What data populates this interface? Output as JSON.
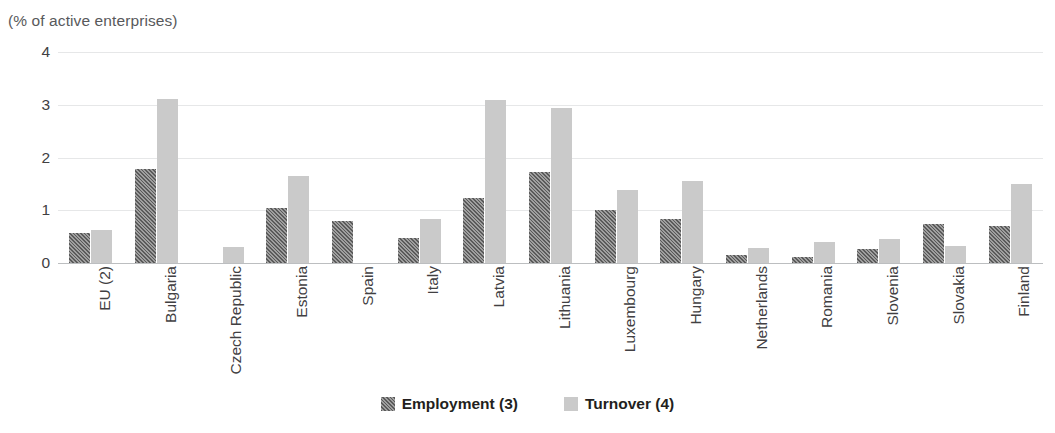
{
  "subtitle": "(% of active enterprises)",
  "clipped_title_fragment": "",
  "legend": {
    "position": "bottom-center",
    "items": [
      {
        "label": "Employment  (3)",
        "swatch": "hatched-dark-gray-swatch",
        "color": "#5a5a5a"
      },
      {
        "label": "Turnover  (4)",
        "swatch": "solid-light-gray-swatch",
        "color": "#cacaca"
      }
    ]
  },
  "axis": {
    "y_ticks": [
      "0",
      "1",
      "2",
      "3",
      "4"
    ],
    "y_min": 0,
    "y_max": 4
  },
  "colors": {
    "employment": "#5a5a5a",
    "turnover": "#cacaca",
    "gridline": "#e6e7e8",
    "baseline": "#bcbec0",
    "text": "#414042",
    "subtitle_text": "#58595b"
  },
  "chart_data": {
    "type": "bar",
    "title": "",
    "subtitle": "(% of active enterprises)",
    "xlabel": "",
    "ylabel": "(% of active enterprises)",
    "ylim": [
      0,
      4
    ],
    "yticks": [
      0,
      1,
      2,
      3,
      4
    ],
    "grid": true,
    "legend_position": "bottom-center",
    "categories": [
      "EU (2)",
      "Bulgaria",
      "Czech Republic",
      "Estonia",
      "Spain",
      "Italy",
      "Latvia",
      "Lithuania",
      "Luxembourg",
      "Hungary",
      "Netherlands",
      "Romania",
      "Slovenia",
      "Slovakia",
      "Finland"
    ],
    "series": [
      {
        "name": "Employment  (3)",
        "color": "#5a5a5a",
        "values": [
          0.57,
          1.79,
          null,
          1.05,
          0.8,
          0.48,
          1.24,
          1.72,
          1.0,
          0.83,
          0.16,
          0.12,
          0.27,
          0.74,
          0.71
        ]
      },
      {
        "name": "Turnover  (4)",
        "color": "#cacaca",
        "values": [
          0.63,
          3.11,
          0.3,
          1.65,
          null,
          0.83,
          3.09,
          2.94,
          1.38,
          1.55,
          0.28,
          0.39,
          0.46,
          0.33,
          1.5
        ]
      }
    ]
  }
}
